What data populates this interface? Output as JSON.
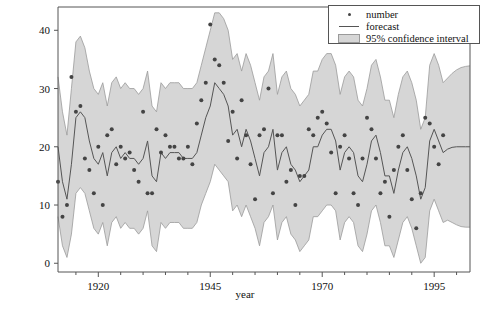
{
  "chart_data": {
    "type": "line",
    "title": "",
    "xlabel": "year",
    "ylabel": "",
    "xlim": [
      1911,
      2003
    ],
    "ylim": [
      -1.5,
      44
    ],
    "xticks": [
      1920,
      1945,
      1970,
      1995
    ],
    "xtick_labels": [
      "1920",
      "1945",
      "1970",
      "1995"
    ],
    "xminor_ticks": [
      1915,
      1925,
      1930,
      1935,
      1940,
      1950,
      1955,
      1960,
      1965,
      1975,
      1980,
      1985,
      1990,
      2000
    ],
    "yticks": [
      0,
      10,
      20,
      30,
      40
    ],
    "ytick_labels": [
      "0",
      "10",
      "20",
      "30",
      "40"
    ],
    "grid": false,
    "legend_position": "top-right",
    "forecast_start_year": 1998,
    "colors": {
      "point": "#444444",
      "line": "#555555",
      "band": "#d6d6d6",
      "band_edge": "#9a9a9a",
      "axis": "#555555",
      "text": "#111111"
    },
    "series": [
      {
        "name": "number",
        "type": "scatter",
        "x": [
          1911,
          1912,
          1913,
          1914,
          1915,
          1916,
          1917,
          1918,
          1919,
          1920,
          1921,
          1922,
          1923,
          1924,
          1925,
          1926,
          1927,
          1928,
          1929,
          1930,
          1931,
          1932,
          1933,
          1934,
          1935,
          1936,
          1937,
          1938,
          1939,
          1940,
          1941,
          1942,
          1943,
          1944,
          1945,
          1946,
          1947,
          1948,
          1949,
          1950,
          1951,
          1952,
          1953,
          1954,
          1955,
          1956,
          1957,
          1958,
          1959,
          1960,
          1961,
          1962,
          1963,
          1964,
          1965,
          1966,
          1967,
          1968,
          1969,
          1970,
          1971,
          1972,
          1973,
          1974,
          1975,
          1976,
          1977,
          1978,
          1979,
          1980,
          1981,
          1982,
          1983,
          1984,
          1985,
          1986,
          1987,
          1988,
          1989,
          1990,
          1991,
          1992,
          1993,
          1994,
          1995,
          1996,
          1997
        ],
        "y": [
          14,
          8,
          10,
          32,
          26,
          27,
          18,
          16,
          12,
          20,
          10,
          22,
          23,
          17,
          20,
          18,
          19,
          16,
          14,
          26,
          12,
          12,
          23,
          19,
          22,
          20,
          20,
          18,
          18,
          20,
          17,
          24,
          28,
          31,
          41,
          35,
          34,
          31,
          21,
          26,
          18,
          28,
          22,
          17,
          11,
          22,
          23,
          30,
          12,
          22,
          22,
          14,
          16,
          10,
          15,
          15,
          23,
          22,
          25,
          26,
          24,
          19,
          12,
          20,
          22,
          18,
          12,
          10,
          18,
          25,
          23,
          18,
          12,
          14,
          8,
          16,
          20,
          22,
          16,
          11,
          6,
          12,
          25,
          24,
          20,
          17,
          22
        ]
      },
      {
        "name": "forecast",
        "type": "line",
        "x": [
          1911,
          1912,
          1913,
          1914,
          1915,
          1916,
          1917,
          1918,
          1919,
          1920,
          1921,
          1922,
          1923,
          1924,
          1925,
          1926,
          1927,
          1928,
          1929,
          1930,
          1931,
          1932,
          1933,
          1934,
          1935,
          1936,
          1937,
          1938,
          1939,
          1940,
          1941,
          1942,
          1943,
          1944,
          1945,
          1946,
          1947,
          1948,
          1949,
          1950,
          1951,
          1952,
          1953,
          1954,
          1955,
          1956,
          1957,
          1958,
          1959,
          1960,
          1961,
          1962,
          1963,
          1964,
          1965,
          1966,
          1967,
          1968,
          1969,
          1970,
          1971,
          1972,
          1973,
          1974,
          1975,
          1976,
          1977,
          1978,
          1979,
          1980,
          1981,
          1982,
          1983,
          1984,
          1985,
          1986,
          1987,
          1988,
          1989,
          1990,
          1991,
          1992,
          1993,
          1994,
          1995,
          1996,
          1997,
          1998,
          1999,
          2000,
          2001,
          2002,
          2003
        ],
        "y": [
          20,
          14,
          11,
          17,
          25,
          26,
          25,
          21,
          18,
          17,
          19,
          15,
          19,
          20,
          18,
          19,
          18,
          18,
          17,
          18,
          21,
          15,
          14,
          19,
          18,
          19,
          19,
          19,
          18,
          18,
          18,
          19,
          22,
          25,
          27,
          31,
          30,
          29,
          27,
          22,
          23,
          20,
          23,
          21,
          18,
          15,
          19,
          20,
          23,
          16,
          19,
          20,
          17,
          16,
          14,
          15,
          16,
          20,
          20,
          22,
          23,
          23,
          21,
          16,
          19,
          20,
          19,
          15,
          14,
          17,
          21,
          22,
          19,
          15,
          15,
          12,
          16,
          19,
          20,
          18,
          15,
          11,
          13,
          21,
          23,
          21,
          19,
          19.6,
          19.9,
          20,
          20,
          20,
          20
        ]
      },
      {
        "name": "95% confidence interval lower",
        "type": "band_lower",
        "x": [
          1911,
          1912,
          1913,
          1914,
          1915,
          1916,
          1917,
          1918,
          1919,
          1920,
          1921,
          1922,
          1923,
          1924,
          1925,
          1926,
          1927,
          1928,
          1929,
          1930,
          1931,
          1932,
          1933,
          1934,
          1935,
          1936,
          1937,
          1938,
          1939,
          1940,
          1941,
          1942,
          1943,
          1944,
          1945,
          1946,
          1947,
          1948,
          1949,
          1950,
          1951,
          1952,
          1953,
          1954,
          1955,
          1956,
          1957,
          1958,
          1959,
          1960,
          1961,
          1962,
          1963,
          1964,
          1965,
          1966,
          1967,
          1968,
          1969,
          1970,
          1971,
          1972,
          1973,
          1974,
          1975,
          1976,
          1977,
          1978,
          1979,
          1980,
          1981,
          1982,
          1983,
          1984,
          1985,
          1986,
          1987,
          1988,
          1989,
          1990,
          1991,
          1992,
          1993,
          1994,
          1995,
          1996,
          1997,
          1998,
          1999,
          2000,
          2001,
          2002,
          2003
        ],
        "y": [
          8,
          3,
          1,
          5,
          12,
          13,
          12,
          9,
          6,
          5,
          7,
          3,
          7,
          8,
          6,
          7,
          6,
          6,
          5,
          6,
          9,
          3,
          2,
          7,
          6,
          7,
          7,
          7,
          6,
          6,
          6,
          7,
          10,
          12,
          14,
          17,
          16,
          15,
          14,
          9,
          10,
          8,
          10,
          8,
          6,
          3,
          7,
          8,
          10,
          4,
          7,
          8,
          5,
          4,
          2,
          3,
          4,
          8,
          8,
          9,
          10,
          10,
          9,
          4,
          7,
          8,
          7,
          3,
          2,
          5,
          9,
          10,
          7,
          3,
          3,
          1,
          4,
          7,
          8,
          6,
          3,
          0,
          1,
          9,
          11,
          9,
          7,
          7.4,
          7,
          6.6,
          6.3,
          6.2,
          6.2
        ]
      },
      {
        "name": "95% confidence interval upper",
        "type": "band_upper",
        "x": [
          1911,
          1912,
          1913,
          1914,
          1915,
          1916,
          1917,
          1918,
          1919,
          1920,
          1921,
          1922,
          1923,
          1924,
          1925,
          1926,
          1927,
          1928,
          1929,
          1930,
          1931,
          1932,
          1933,
          1934,
          1935,
          1936,
          1937,
          1938,
          1939,
          1940,
          1941,
          1942,
          1943,
          1944,
          1945,
          1946,
          1947,
          1948,
          1949,
          1950,
          1951,
          1952,
          1953,
          1954,
          1955,
          1956,
          1957,
          1958,
          1959,
          1960,
          1961,
          1962,
          1963,
          1964,
          1965,
          1966,
          1967,
          1968,
          1969,
          1970,
          1971,
          1972,
          1973,
          1974,
          1975,
          1976,
          1977,
          1978,
          1979,
          1980,
          1981,
          1982,
          1983,
          1984,
          1985,
          1986,
          1987,
          1988,
          1989,
          1990,
          1991,
          1992,
          1993,
          1994,
          1995,
          1996,
          1997,
          1998,
          1999,
          2000,
          2001,
          2002,
          2003
        ],
        "y": [
          32,
          26,
          22,
          30,
          38,
          39,
          37,
          33,
          30,
          29,
          31,
          27,
          31,
          32,
          30,
          31,
          30,
          30,
          29,
          30,
          33,
          27,
          26,
          31,
          30,
          31,
          31,
          31,
          30,
          30,
          30,
          31,
          34,
          37,
          40,
          43,
          43,
          42,
          40,
          35,
          36,
          33,
          36,
          34,
          31,
          28,
          32,
          33,
          36,
          29,
          32,
          33,
          30,
          29,
          27,
          28,
          29,
          33,
          33,
          35,
          36,
          36,
          34,
          29,
          32,
          33,
          32,
          28,
          27,
          30,
          34,
          35,
          32,
          28,
          28,
          25,
          29,
          32,
          33,
          31,
          28,
          23,
          25,
          34,
          36,
          34,
          31,
          31.8,
          32.6,
          33.2,
          33.6,
          33.8,
          33.9
        ]
      }
    ],
    "legend": [
      {
        "label": "number",
        "key": "point-marker"
      },
      {
        "label": "forecast",
        "key": "line-marker"
      },
      {
        "label": "95% confidence interval",
        "key": "band-marker"
      }
    ]
  }
}
